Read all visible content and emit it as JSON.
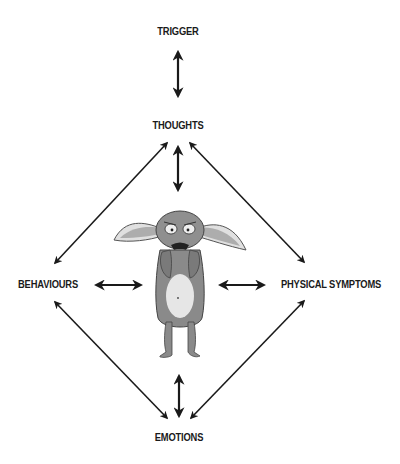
{
  "diagram": {
    "type": "cognitive-behavioural cycle",
    "nodes": {
      "trigger": "TRIGGER",
      "thoughts": "THOUGHTS",
      "behaviours": "BEHAVIOURS",
      "physical_symptoms": "PHYSICAL SYMPTOMS",
      "emotions": "EMOTIONS"
    },
    "edges": [
      {
        "from": "TRIGGER",
        "to": "THOUGHTS",
        "style": "double-arrow"
      },
      {
        "from": "THOUGHTS",
        "to": "BEHAVIOURS",
        "style": "double-arrow"
      },
      {
        "from": "THOUGHTS",
        "to": "PHYSICAL SYMPTOMS",
        "style": "double-arrow"
      },
      {
        "from": "THOUGHTS",
        "to": "CENTRE",
        "style": "double-arrow"
      },
      {
        "from": "BEHAVIOURS",
        "to": "CENTRE",
        "style": "double-arrow"
      },
      {
        "from": "PHYSICAL SYMPTOMS",
        "to": "CENTRE",
        "style": "double-arrow"
      },
      {
        "from": "EMOTIONS",
        "to": "CENTRE",
        "style": "double-arrow"
      },
      {
        "from": "BEHAVIOURS",
        "to": "EMOTIONS",
        "style": "double-arrow"
      },
      {
        "from": "PHYSICAL SYMPTOMS",
        "to": "EMOTIONS",
        "style": "double-arrow"
      }
    ],
    "centre_illustration": "anxious-creature",
    "colors": {
      "ink": "#1a1a1a",
      "creature_body": "#8a8a8a",
      "creature_belly": "#e6e6e6",
      "background": "#ffffff"
    }
  }
}
